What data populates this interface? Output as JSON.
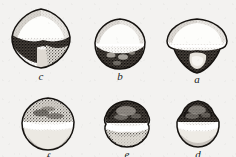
{
  "plate": {
    "title": "Plate of six specimen drawings",
    "description": "Stipple-and-ink scientific illustration of six rounded specimens arranged in two rows of three, each labelled with an italic letter.",
    "background_color": "#f3f2f0",
    "ink_color": "#1a1715",
    "width": 236,
    "height": 157,
    "rows": 2,
    "columns": 3
  },
  "specimens": [
    {
      "id": "fig-c",
      "label": "c",
      "row": 1,
      "column": 1,
      "outline": "rounded-diamond",
      "size": {
        "width": 62,
        "height": 62
      },
      "position": {
        "x": 10,
        "y": 8
      },
      "caption_y": 68,
      "shading": "pale stippled upper half with broad dark band below the equator and heavy dark patch on the lower left",
      "tone": {
        "upper": "light",
        "band": "dark",
        "lower": "medium-dark"
      }
    },
    {
      "id": "fig-b",
      "label": "b",
      "row": 1,
      "column": 2,
      "outline": "rounded-dome",
      "size": {
        "width": 52,
        "height": 52
      },
      "position": {
        "x": 94,
        "y": 18
      },
      "caption_y": 68,
      "shading": "light stippled dome above a narrow white line, dark mottled lower third",
      "tone": {
        "upper": "light",
        "band": "white",
        "lower": "dark"
      }
    },
    {
      "id": "fig-a",
      "label": "a",
      "row": 1,
      "column": 3,
      "outline": "dome-over-cone",
      "size": {
        "width": 62,
        "height": 54
      },
      "position": {
        "x": 166,
        "y": 18
      },
      "caption_y": 68,
      "shading": "broad light stippled dome over a dark triangular base enclosing a pale central patch",
      "tone": {
        "upper": "light",
        "band": "white",
        "lower": "very-dark"
      }
    },
    {
      "id": "fig-f",
      "label": "f",
      "row": 2,
      "column": 1,
      "outline": "rounded-pentagonal",
      "size": {
        "width": 54,
        "height": 54
      },
      "position": {
        "x": 21,
        "y": 97
      },
      "caption_y": 137,
      "shading": "dark stippled cap above a white equatorial band, pale stippled lower body",
      "tone": {
        "upper": "medium-dark",
        "band": "white",
        "lower": "light"
      }
    },
    {
      "id": "fig-e",
      "label": "e",
      "row": 2,
      "column": 2,
      "outline": "rounded-polygonal",
      "size": {
        "width": 48,
        "height": 48
      },
      "position": {
        "x": 103,
        "y": 100
      },
      "caption_y": 137,
      "shading": "dark granular cap, bright white equatorial stripe, medium stippled lower half",
      "tone": {
        "upper": "dark",
        "band": "white",
        "lower": "medium"
      }
    },
    {
      "id": "fig-d",
      "label": "d",
      "row": 2,
      "column": 3,
      "outline": "rounded-bell",
      "size": {
        "width": 46,
        "height": 48
      },
      "position": {
        "x": 175,
        "y": 100
      },
      "caption_y": 137,
      "shading": "dark coarse cap over a white band with a pale stippled lower dome",
      "tone": {
        "upper": "dark",
        "band": "white",
        "lower": "light"
      }
    }
  ]
}
